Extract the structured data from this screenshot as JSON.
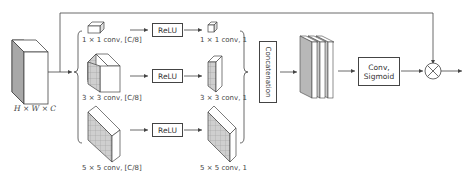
{
  "diagram": {
    "type": "attention-module",
    "input": {
      "label": "H × W × C"
    },
    "branches": [
      {
        "conv_in": "1 × 1 conv, [C/8]",
        "activation": "ReLU",
        "conv_out": "1 × 1 conv, 1"
      },
      {
        "conv_in": "3 × 3 conv, [C/8]",
        "activation": "ReLU",
        "conv_out": "3 × 3 conv, 1"
      },
      {
        "conv_in": "5 × 5 conv, [C/8]",
        "activation": "ReLU",
        "conv_out": "5 × 5 conv, 1"
      }
    ],
    "concat": {
      "label": "Concatenation"
    },
    "conv_sigmoid": {
      "line1": "Conv,",
      "line2": "Sigmoid"
    },
    "multiply": {
      "symbol": "⊗"
    },
    "colors": {
      "stroke": "#444444",
      "shade": "#a8a8a8",
      "face": "#ffffff",
      "grid": "#bbbbbb"
    }
  }
}
